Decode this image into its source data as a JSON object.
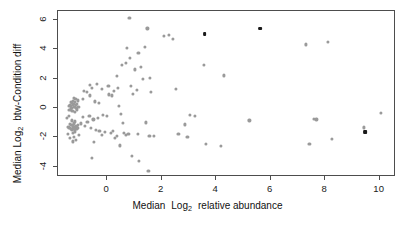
{
  "figure": {
    "background_color": "#ffffff",
    "frame_color": "#4d4d4d",
    "point_color": "#9a9a9a",
    "highlight_color": "#1a1a1a"
  },
  "axes": {
    "x": {
      "title_prefix": "Median",
      "title_log": "Log",
      "title_sub": "2",
      "title_suffix": "relative abundance",
      "title_full": "Median Log2 relative abundance",
      "ticks": [
        "0",
        "2",
        "4",
        "6",
        "8",
        "10"
      ],
      "tick_values": [
        0,
        2,
        4,
        6,
        8,
        10
      ],
      "range": [
        -1.8,
        10.6
      ]
    },
    "y": {
      "title_prefix": "Median",
      "title_log": "Log",
      "title_sub": "2",
      "title_suffix": "btw-Condition diff",
      "title_full": "Median Log2 btw-Condition diff",
      "ticks": [
        "6",
        "4",
        "2",
        "0",
        "-2",
        "-4"
      ],
      "tick_values": [
        6,
        4,
        2,
        0,
        -2,
        -4
      ],
      "range": [
        -4.7,
        6.6
      ]
    }
  },
  "chart_data": {
    "type": "scatter",
    "title": "",
    "xlabel": "Median Log2 relative abundance",
    "ylabel": "Median Log2 btw-Condition diff",
    "xlim": [
      -1.8,
      10.6
    ],
    "ylim": [
      -4.7,
      6.6
    ],
    "grid": false,
    "legend": null,
    "series": [
      {
        "name": "proteins",
        "color": "#9a9a9a",
        "marker": "circle",
        "points": [
          [
            -1.3,
            0.35
          ],
          [
            -1.26,
            0.2
          ],
          [
            -1.22,
            0.28
          ],
          [
            -1.34,
            0.1
          ],
          [
            -1.18,
            0.4
          ],
          [
            -1.28,
            -0.02
          ],
          [
            -1.2,
            0.05
          ],
          [
            -1.15,
            0.18
          ],
          [
            -1.32,
            0.42
          ],
          [
            -1.24,
            0.5
          ],
          [
            -1.1,
            0.3
          ],
          [
            -1.36,
            0.22
          ],
          [
            -1.12,
            -0.1
          ],
          [
            -1.27,
            -0.18
          ],
          [
            -1.19,
            -0.25
          ],
          [
            -1.33,
            -0.05
          ],
          [
            -1.08,
            0.52
          ],
          [
            -1.4,
            0.15
          ],
          [
            -1.16,
            0.6
          ],
          [
            -1.23,
            0.7
          ],
          [
            -1.05,
            0.08
          ],
          [
            -1.38,
            -0.12
          ],
          [
            -1.14,
            0.0
          ],
          [
            -1.29,
            0.34
          ],
          [
            -1.31,
            -1.18
          ],
          [
            -1.25,
            -1.25
          ],
          [
            -1.2,
            -1.32
          ],
          [
            -1.35,
            -1.1
          ],
          [
            -1.15,
            -1.22
          ],
          [
            -1.27,
            -1.4
          ],
          [
            -1.18,
            -1.48
          ],
          [
            -1.1,
            -1.3
          ],
          [
            -1.38,
            -1.35
          ],
          [
            -1.22,
            -1.05
          ],
          [
            -1.12,
            -1.42
          ],
          [
            -1.3,
            -1.52
          ],
          [
            -1.06,
            -1.15
          ],
          [
            -1.42,
            -1.28
          ],
          [
            -1.17,
            -1.6
          ],
          [
            -1.24,
            -1.68
          ],
          [
            -1.08,
            -1.38
          ],
          [
            -1.33,
            -1.45
          ],
          [
            -1.28,
            -0.85
          ],
          [
            -1.19,
            -0.92
          ],
          [
            -1.36,
            -2.05
          ],
          [
            -1.21,
            -1.95
          ],
          [
            -1.13,
            -2.15
          ],
          [
            -1.26,
            -2.28
          ],
          [
            -1.4,
            -0.55
          ],
          [
            -1.45,
            -1.75
          ],
          [
            -1.02,
            -1.85
          ],
          [
            -1.48,
            -0.7
          ],
          [
            -0.95,
            -1.05
          ],
          [
            -0.88,
            -0.6
          ],
          [
            -0.8,
            -1.22
          ],
          [
            -0.72,
            -0.95
          ],
          [
            -0.65,
            -0.52
          ],
          [
            -0.58,
            -1.35
          ],
          [
            -0.5,
            -0.78
          ],
          [
            -0.42,
            -1.48
          ],
          [
            -0.9,
            0.62
          ],
          [
            -0.75,
            1.08
          ],
          [
            -0.62,
            0.85
          ],
          [
            -0.55,
            1.35
          ],
          [
            -0.45,
            0.45
          ],
          [
            -0.35,
            -0.68
          ],
          [
            -0.28,
            -1.55
          ],
          [
            -0.2,
            -1.82
          ],
          [
            -0.48,
            -2.3
          ],
          [
            -0.55,
            -3.38
          ],
          [
            -0.3,
            0.35
          ],
          [
            -0.15,
            -0.48
          ],
          [
            -0.08,
            -1.62
          ],
          [
            0.0,
            -0.55
          ],
          [
            0.08,
            0.92
          ],
          [
            0.15,
            -1.72
          ],
          [
            0.22,
            -1.58
          ],
          [
            0.3,
            -2.02
          ],
          [
            0.35,
            -1.9
          ],
          [
            0.42,
            0.12
          ],
          [
            0.5,
            -0.42
          ],
          [
            0.58,
            -1.02
          ],
          [
            0.62,
            -1.7
          ],
          [
            0.7,
            -1.85
          ],
          [
            0.78,
            -1.78
          ],
          [
            0.82,
            6.12
          ],
          [
            0.85,
            3.38
          ],
          [
            0.88,
            1.48
          ],
          [
            0.9,
            -3.25
          ],
          [
            0.95,
            0.95
          ],
          [
            1.02,
            2.62
          ],
          [
            1.08,
            1.22
          ],
          [
            1.12,
            -1.78
          ],
          [
            1.18,
            -3.62
          ],
          [
            1.25,
            2.78
          ],
          [
            1.3,
            1.95
          ],
          [
            1.38,
            4.15
          ],
          [
            1.42,
            -0.98
          ],
          [
            1.48,
            5.42
          ],
          [
            1.52,
            -4.28
          ],
          [
            1.55,
            -1.88
          ],
          [
            1.58,
            2.05
          ],
          [
            1.62,
            1.12
          ],
          [
            0.55,
            2.95
          ],
          [
            0.4,
            1.35
          ],
          [
            0.25,
            1.18
          ],
          [
            0.18,
            0.85
          ],
          [
            0.05,
            1.52
          ],
          [
            -0.18,
            1.28
          ],
          [
            -0.38,
            1.62
          ],
          [
            0.68,
            3.05
          ],
          [
            0.72,
            4.08
          ],
          [
            0.35,
            2.18
          ],
          [
            1.15,
            3.72
          ],
          [
            0.48,
            -2.55
          ],
          [
            2.1,
            4.92
          ],
          [
            2.28,
            5.0
          ],
          [
            2.42,
            4.72
          ],
          [
            2.52,
            1.32
          ],
          [
            2.85,
            -1.12
          ],
          [
            2.95,
            -1.95
          ],
          [
            3.05,
            -0.48
          ],
          [
            3.22,
            -0.55
          ],
          [
            3.55,
            2.95
          ],
          [
            3.62,
            -2.45
          ],
          [
            4.18,
            -2.58
          ],
          [
            4.28,
            2.22
          ],
          [
            5.22,
            -0.85
          ],
          [
            7.28,
            4.32
          ],
          [
            7.42,
            -2.45
          ],
          [
            7.58,
            -0.72
          ],
          [
            7.68,
            -0.78
          ],
          [
            8.1,
            4.48
          ],
          [
            8.25,
            -2.12
          ],
          [
            9.42,
            -1.32
          ],
          [
            10.05,
            -0.35
          ],
          [
            2.62,
            -1.75
          ],
          [
            1.72,
            -1.92
          ],
          [
            -0.62,
            1.55
          ],
          [
            -0.85,
            1.18
          ]
        ]
      },
      {
        "name": "highlighted",
        "color": "#1a1a1a",
        "marker": "square",
        "points": [
          [
            3.58,
            5.05
          ],
          [
            5.62,
            5.4
          ],
          [
            9.48,
            -1.65
          ]
        ]
      }
    ]
  }
}
